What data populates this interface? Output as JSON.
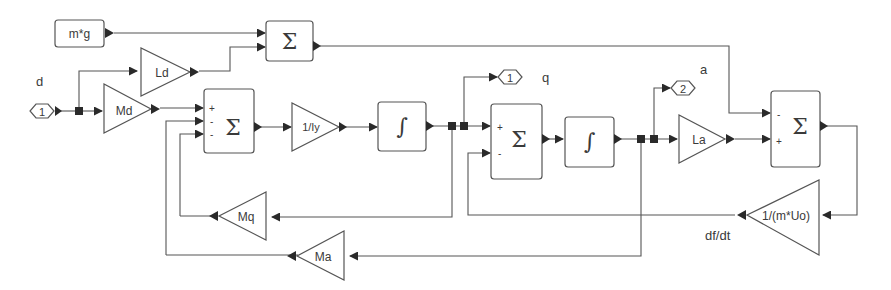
{
  "diagram": {
    "type": "simulink-block-diagram",
    "inports": [
      {
        "id": "in1",
        "number": "1",
        "label": "d"
      }
    ],
    "outports": [
      {
        "id": "out1",
        "number": "1",
        "label": "q"
      },
      {
        "id": "out2",
        "number": "2",
        "label": "a"
      }
    ],
    "constants": [
      {
        "id": "mg",
        "label": "m*g"
      }
    ],
    "gains": [
      {
        "id": "Ld",
        "label": "Ld"
      },
      {
        "id": "Md",
        "label": "Md"
      },
      {
        "id": "invIy",
        "label": "1/Iy"
      },
      {
        "id": "La",
        "label": "La"
      },
      {
        "id": "Mq",
        "label": "Mq"
      },
      {
        "id": "Ma",
        "label": "Ma"
      },
      {
        "id": "invmUo",
        "label": "1/(m*Uo)"
      }
    ],
    "sums": [
      {
        "id": "sum_top",
        "symbol": "Σ",
        "signs": [
          "",
          ""
        ]
      },
      {
        "id": "sum_q",
        "symbol": "Σ",
        "signs": [
          "+",
          "-",
          "-"
        ]
      },
      {
        "id": "sum_a",
        "symbol": "Σ",
        "signs": [
          "+",
          "-"
        ]
      },
      {
        "id": "sum_f",
        "symbol": "Σ",
        "signs": [
          "-",
          "+"
        ]
      }
    ],
    "integrators": [
      {
        "id": "int1",
        "symbol": "∫"
      },
      {
        "id": "int2",
        "symbol": "∫"
      }
    ],
    "signal_labels": [
      {
        "id": "dfdt",
        "label": "df/dt"
      }
    ],
    "connections": [
      {
        "from": "in1",
        "to": "Ld"
      },
      {
        "from": "in1",
        "to": "Md"
      },
      {
        "from": "mg",
        "to": "sum_top"
      },
      {
        "from": "Ld",
        "to": "sum_top"
      },
      {
        "from": "Md",
        "to": "sum_q",
        "sign": "+"
      },
      {
        "from": "Ma",
        "to": "sum_q",
        "sign": "-"
      },
      {
        "from": "Mq",
        "to": "sum_q",
        "sign": "-"
      },
      {
        "from": "sum_q",
        "to": "invIy"
      },
      {
        "from": "invIy",
        "to": "int1"
      },
      {
        "from": "int1",
        "to": "out1"
      },
      {
        "from": "int1",
        "to": "sum_a",
        "sign": "+"
      },
      {
        "from": "int1",
        "to": "Mq"
      },
      {
        "from": "invmUo",
        "to": "sum_a",
        "sign": "-"
      },
      {
        "from": "sum_a",
        "to": "int2"
      },
      {
        "from": "int2",
        "to": "out2"
      },
      {
        "from": "int2",
        "to": "La"
      },
      {
        "from": "int2",
        "to": "Ma"
      },
      {
        "from": "sum_top",
        "to": "sum_f",
        "sign": "-"
      },
      {
        "from": "La",
        "to": "sum_f",
        "sign": "+"
      },
      {
        "from": "sum_f",
        "to": "invmUo"
      }
    ]
  }
}
